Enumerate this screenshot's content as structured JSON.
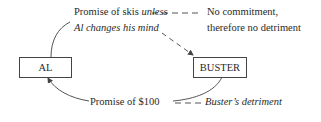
{
  "diagram": {
    "nodes": {
      "al": {
        "label": "AL"
      },
      "buster": {
        "label": "BUSTER"
      }
    },
    "top_edge": {
      "label_line1_normal": "Promise of skis ",
      "label_line1_italic": "unless",
      "label_line2_italic": "Al changes his mind",
      "dash_connector": "– – –",
      "note_line1": "No commitment,",
      "note_line2": "therefore no detriment",
      "from": "AL",
      "to": "BUSTER",
      "style": "dashed-arrow"
    },
    "bottom_edge": {
      "label": "Promise of $100",
      "dash_connector": "– – –",
      "note_italic": "Buster’s detriment",
      "from": "BUSTER",
      "to": "AL",
      "style": "solid-arrow"
    },
    "colors": {
      "line": "#555555",
      "text": "#2a2a2a",
      "background": "#ffffff"
    }
  }
}
